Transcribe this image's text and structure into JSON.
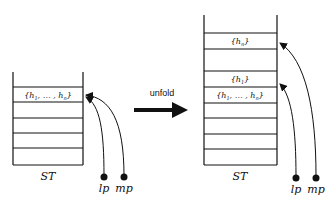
{
  "diagram": {
    "arrow_label": "unfold",
    "before": {
      "stack_label": "ST",
      "cells": [
        "{h1, ... , hn}",
        "",
        "",
        "",
        "",
        ""
      ],
      "pointers": [
        "lp",
        "mp"
      ]
    },
    "after": {
      "stack_label": "ST",
      "cells": [
        "{hn}",
        "",
        "{h1}",
        "{h1, ... , hn}",
        "",
        "",
        "",
        "",
        ""
      ],
      "pointers": [
        "lp",
        "mp"
      ]
    }
  }
}
